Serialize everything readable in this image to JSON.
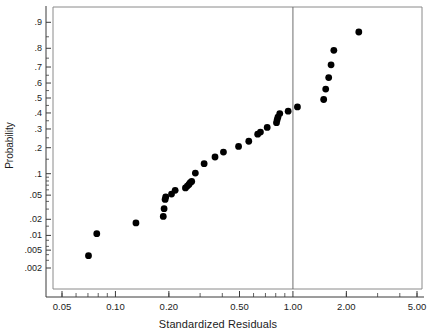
{
  "chart_data": {
    "type": "scatter",
    "title": "",
    "subtitle": "",
    "xlabel": "Standardized Residuals",
    "ylabel": "Probability",
    "xscale": "log",
    "yscale": "normal-probability",
    "xlim": [
      0.042,
      5.9
    ],
    "ylim": [
      0.0014,
      0.95
    ],
    "grid": false,
    "legend": null,
    "xticks": [
      {
        "value": 0.05,
        "label": "0.05"
      },
      {
        "value": 0.1,
        "label": "0.10"
      },
      {
        "value": 0.2,
        "label": "0.20"
      },
      {
        "value": 0.5,
        "label": "0.50"
      },
      {
        "value": 1.0,
        "label": "1.00"
      },
      {
        "value": 2.0,
        "label": "2.00"
      },
      {
        "value": 5.0,
        "label": "5.00"
      }
    ],
    "yticks": [
      {
        "value": 0.9,
        "label": ".9"
      },
      {
        "value": 0.8,
        "label": ".8"
      },
      {
        "value": 0.7,
        "label": ".7"
      },
      {
        "value": 0.6,
        "label": ".6"
      },
      {
        "value": 0.5,
        "label": ".5"
      },
      {
        "value": 0.4,
        "label": ".4"
      },
      {
        "value": 0.3,
        "label": ".3"
      },
      {
        "value": 0.2,
        "label": ".2"
      },
      {
        "value": 0.1,
        "label": ".1"
      },
      {
        "value": 0.05,
        "label": ".05"
      },
      {
        "value": 0.02,
        "label": ".02"
      },
      {
        "value": 0.01,
        "label": ".01"
      },
      {
        "value": 0.005,
        "label": ".005"
      },
      {
        "value": 0.002,
        "label": ".002"
      }
    ],
    "annotations": [
      {
        "kind": "vertical-reference-line",
        "x": 1.0,
        "color": "#6e6e6e"
      }
    ],
    "marker": {
      "shape": "circle",
      "color": "#000000",
      "size": 3.4
    },
    "points": [
      {
        "x": 0.0705,
        "y": 0.0038
      },
      {
        "x": 0.0785,
        "y": 0.0108
      },
      {
        "x": 0.1305,
        "y": 0.0172
      },
      {
        "x": 0.186,
        "y": 0.0225
      },
      {
        "x": 0.188,
        "y": 0.0305
      },
      {
        "x": 0.1905,
        "y": 0.043
      },
      {
        "x": 0.192,
        "y": 0.047
      },
      {
        "x": 0.207,
        "y": 0.052
      },
      {
        "x": 0.217,
        "y": 0.059
      },
      {
        "x": 0.248,
        "y": 0.064
      },
      {
        "x": 0.254,
        "y": 0.068
      },
      {
        "x": 0.2595,
        "y": 0.0715
      },
      {
        "x": 0.264,
        "y": 0.076
      },
      {
        "x": 0.269,
        "y": 0.079
      },
      {
        "x": 0.282,
        "y": 0.102
      },
      {
        "x": 0.316,
        "y": 0.133
      },
      {
        "x": 0.364,
        "y": 0.159
      },
      {
        "x": 0.406,
        "y": 0.18
      },
      {
        "x": 0.494,
        "y": 0.206
      },
      {
        "x": 0.564,
        "y": 0.232
      },
      {
        "x": 0.633,
        "y": 0.27
      },
      {
        "x": 0.656,
        "y": 0.282
      },
      {
        "x": 0.716,
        "y": 0.309
      },
      {
        "x": 0.808,
        "y": 0.338
      },
      {
        "x": 0.815,
        "y": 0.356
      },
      {
        "x": 0.823,
        "y": 0.373
      },
      {
        "x": 0.843,
        "y": 0.396
      },
      {
        "x": 0.94,
        "y": 0.412
      },
      {
        "x": 1.06,
        "y": 0.44
      },
      {
        "x": 1.49,
        "y": 0.49
      },
      {
        "x": 1.53,
        "y": 0.56
      },
      {
        "x": 1.59,
        "y": 0.635
      },
      {
        "x": 1.64,
        "y": 0.713
      },
      {
        "x": 1.7,
        "y": 0.79
      },
      {
        "x": 2.35,
        "y": 0.868
      }
    ]
  },
  "figure": {
    "plot_frame_color": "#8a8a8a",
    "axis_color": "#3a3a3a",
    "background": "#ffffff"
  }
}
